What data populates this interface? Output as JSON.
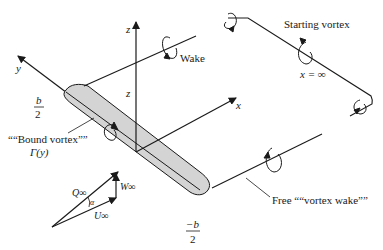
{
  "diagram": {
    "axes": {
      "x": "x",
      "y": "y",
      "z": "z",
      "z_height": "z"
    },
    "labels": {
      "wake": "Wake",
      "starting_vortex": "Starting vortex",
      "x_infinity": "x = ∞",
      "half_span_pos_num": "b",
      "half_span_pos_den": "2",
      "half_span_neg_num": "−b",
      "half_span_neg_den": "2",
      "bound_vortex": "““Bound vortex””",
      "gamma": "Γ(y)",
      "free_vortex_wake": "Free ““vortex wake””"
    },
    "velocity_triangle": {
      "Q": "Q∞",
      "U": "U∞",
      "W": "W∞",
      "alpha": "α"
    },
    "colors": {
      "wing_fill": "#d4d4d4",
      "line": "#1a1a1a"
    }
  }
}
